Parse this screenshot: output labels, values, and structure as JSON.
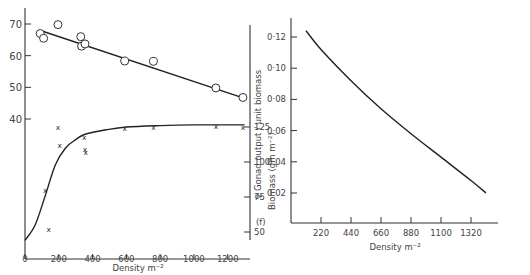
{
  "chart_data": [
    {
      "type": "scatter",
      "title": "",
      "xlabel": "Density m⁻²",
      "x_ticks": [
        0,
        200,
        400,
        600,
        800,
        1000,
        1200
      ],
      "xlim": [
        0,
        1320
      ],
      "left_axis": {
        "ylabel": "",
        "ticks": [
          40,
          50,
          60,
          70
        ],
        "ylim": [
          30,
          74
        ]
      },
      "right_axis": {
        "ylabel": "Biomass (gm m⁻²)",
        "ticks": [
          50,
          75,
          100,
          125
        ],
        "ylim": [
          44,
          140
        ]
      },
      "series": [
        {
          "name": "upper (circles)",
          "marker": "circle",
          "axis": "left",
          "points": [
            [
              90,
              67
            ],
            [
              110,
              65.5
            ],
            [
              195,
              69.8
            ],
            [
              330,
              66
            ],
            [
              335,
              63
            ],
            [
              355,
              63.7
            ],
            [
              590,
              58.3
            ],
            [
              760,
              58.2
            ],
            [
              1130,
              49.8
            ],
            [
              1290,
              46.8
            ]
          ],
          "fit_line": [
            [
              100,
              67.8
            ],
            [
              1300,
              46.5
            ]
          ]
        },
        {
          "name": "lower (crosses)",
          "marker": "x",
          "axis": "right",
          "points": [
            [
              120,
              80
            ],
            [
              140,
              52
            ],
            [
              195,
              125
            ],
            [
              205,
              112
            ],
            [
              350,
              118
            ],
            [
              355,
              109
            ],
            [
              360,
              107.5
            ],
            [
              590,
              124
            ],
            [
              760,
              125
            ],
            [
              1130,
              126
            ],
            [
              1290,
              125
            ]
          ],
          "fit_curve": [
            [
              0,
              44
            ],
            [
              60,
              55
            ],
            [
              120,
              76
            ],
            [
              180,
              98
            ],
            [
              240,
              110
            ],
            [
              300,
              116
            ],
            [
              360,
              120
            ],
            [
              480,
              123
            ],
            [
              600,
              125
            ],
            [
              800,
              126
            ],
            [
              1000,
              126.5
            ],
            [
              1300,
              126.5
            ]
          ]
        }
      ]
    },
    {
      "type": "line",
      "title": "",
      "panel_label": "(f)",
      "xlabel": "Density m⁻²",
      "ylabel": "♀ Gonad output / unit biomass",
      "x_ticks": [
        220,
        440,
        660,
        880,
        1100,
        1320
      ],
      "y_ticks": [
        0.02,
        0.04,
        0.06,
        0.08,
        0.1,
        0.12
      ],
      "y_tick_labels": [
        "0·02",
        "0·04",
        "0·06",
        "0·08",
        "0·10",
        "0·12"
      ],
      "xlim": [
        0,
        1500
      ],
      "ylim": [
        0,
        0.13
      ],
      "series": [
        {
          "name": "gonad output",
          "values": [
            [
              110,
              0.124
            ],
            [
              220,
              0.112
            ],
            [
              440,
              0.092
            ],
            [
              660,
              0.074
            ],
            [
              880,
              0.058
            ],
            [
              1100,
              0.043
            ],
            [
              1320,
              0.028
            ],
            [
              1430,
              0.02
            ]
          ]
        }
      ]
    }
  ]
}
